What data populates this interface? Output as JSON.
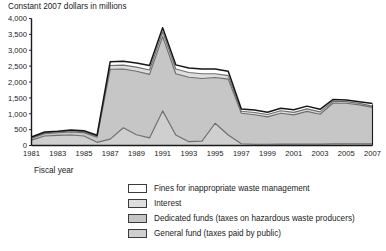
{
  "chart_data": {
    "type": "area",
    "stacked": true,
    "title": "Constant 2007 dollars in millions",
    "xlabel": "Fiscal year",
    "ylabel": "",
    "grid": false,
    "legend_position": "bottom",
    "xlim": [
      1981,
      2007
    ],
    "ylim": [
      0,
      4000
    ],
    "ytick_labels": [
      "0",
      "500",
      "1,000",
      "1,500",
      "2,000",
      "2,500",
      "3,000",
      "3,500",
      "4,000"
    ],
    "ytick_values": [
      0,
      500,
      1000,
      1500,
      2000,
      2500,
      3000,
      3500,
      4000
    ],
    "xtick_labels": [
      "1981",
      "1983",
      "1985",
      "1987",
      "1989",
      "1991",
      "1993",
      "1995",
      "1997",
      "1999",
      "2001",
      "2003",
      "2005",
      "2007"
    ],
    "xtick_values": [
      1981,
      1983,
      1985,
      1987,
      1989,
      1991,
      1993,
      1995,
      1997,
      1999,
      2001,
      2003,
      2005,
      2007
    ],
    "x": [
      1981,
      1982,
      1983,
      1984,
      1985,
      1986,
      1987,
      1988,
      1989,
      1990,
      1991,
      1992,
      1993,
      1994,
      1995,
      1996,
      1997,
      1998,
      1999,
      2000,
      2001,
      2002,
      2003,
      2004,
      2005,
      2006,
      2007
    ],
    "series": [
      {
        "name": "General fund (taxes paid by public)",
        "color": "#cfcfcf",
        "values": [
          170,
          300,
          320,
          330,
          300,
          100,
          200,
          560,
          340,
          240,
          1090,
          330,
          120,
          140,
          700,
          330,
          55,
          40,
          40,
          45,
          45,
          45,
          45,
          50,
          50,
          50,
          50
        ]
      },
      {
        "name": "Dedicated funds (taxes on hazardous waste producers)",
        "color": "#c6c6c6",
        "values": [
          60,
          75,
          80,
          95,
          105,
          160,
          2200,
          1850,
          2000,
          2000,
          2340,
          1930,
          2030,
          1970,
          1440,
          1760,
          960,
          930,
          860,
          970,
          920,
          1030,
          940,
          1290,
          1280,
          1230,
          1150
        ]
      },
      {
        "name": "Interest",
        "color": "#dedede",
        "values": [
          20,
          25,
          25,
          30,
          30,
          35,
          120,
          120,
          130,
          140,
          150,
          150,
          150,
          150,
          120,
          110,
          65,
          70,
          75,
          80,
          80,
          80,
          75,
          55,
          50,
          45,
          40
        ]
      },
      {
        "name": "Fines for inappropriate waste management",
        "color": "#ffffff",
        "values": [
          20,
          25,
          25,
          30,
          30,
          30,
          120,
          120,
          130,
          140,
          130,
          130,
          140,
          150,
          150,
          140,
          70,
          75,
          75,
          80,
          80,
          85,
          80,
          55,
          55,
          55,
          80
        ]
      }
    ],
    "totals": [
      270,
      425,
      450,
      485,
      465,
      325,
      2640,
      2650,
      2600,
      2520,
      3710,
      2540,
      2440,
      2410,
      2410,
      2340,
      1150,
      1115,
      1050,
      1175,
      1125,
      1240,
      1140,
      1450,
      1435,
      1380,
      1320
    ]
  },
  "legend": {
    "items": [
      {
        "label": "Fines for inappropriate waste management",
        "color": "#ffffff"
      },
      {
        "label": "Interest",
        "color": "#dedede"
      },
      {
        "label": "Dedicated funds (taxes on hazardous waste producers)",
        "color": "#c6c6c6"
      },
      {
        "label": "General fund (taxes paid by public)",
        "color": "#cfcfcf"
      }
    ]
  }
}
